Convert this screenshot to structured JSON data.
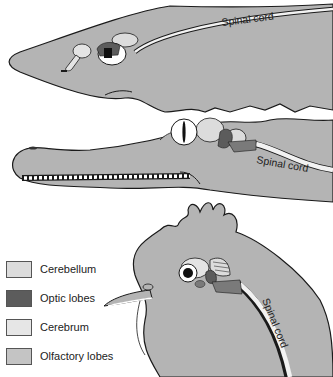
{
  "figure": {
    "animals": [
      {
        "name": "shark",
        "label": "Spinal cord"
      },
      {
        "name": "crocodile",
        "label": "Spinal cord"
      },
      {
        "name": "chicken",
        "label": "Spinal cord"
      }
    ],
    "colors": {
      "body": "#b4b4b4",
      "outline": "#1a1a1a",
      "cerebellum": "#dcdcdc",
      "optic_lobes": "#5c5c5c",
      "cerebrum": "#e4e4e4",
      "olfactory_lobes": "#c2c2c2",
      "brainstem": "#7a7a7a",
      "spinal_cord": "#f2f2f2",
      "background": "#ffffff"
    }
  },
  "legend": {
    "items": [
      {
        "label": "Cerebellum",
        "color": "#dcdcdc"
      },
      {
        "label": "Optic lobes",
        "color": "#5c5c5c"
      },
      {
        "label": "Cerebrum",
        "color": "#e6e6e6"
      },
      {
        "label": "Olfactory lobes",
        "color": "#c4c4c4"
      }
    ]
  }
}
